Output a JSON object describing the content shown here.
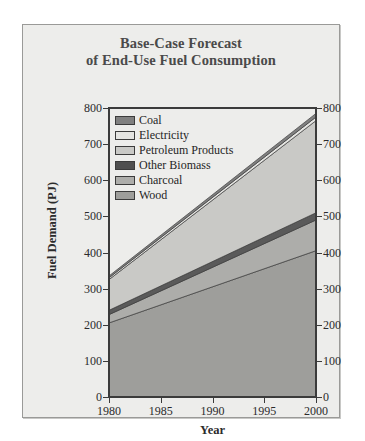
{
  "chart_data": {
    "type": "area",
    "title": "Base-Case Forecast of End-Use Fuel Consumption",
    "title_line1": "Base-Case Forecast",
    "title_line2": "of End-Use Fuel Consumption",
    "xlabel": "Year",
    "ylabel": "Fuel Demand (PJ)",
    "xlim": [
      1980,
      2000
    ],
    "ylim": [
      0,
      800
    ],
    "xticks": [
      1980,
      1985,
      1990,
      1995,
      2000
    ],
    "yticks": [
      0,
      100,
      200,
      300,
      400,
      500,
      600,
      700,
      800
    ],
    "grid": false,
    "stacked": true,
    "legend_position": "upper-left-inside",
    "x": [
      1980,
      2000
    ],
    "series": [
      {
        "name": "Wood",
        "color": "#9e9e9b",
        "values": [
          205,
          405
        ]
      },
      {
        "name": "Charcoal",
        "color": "#adadaa",
        "values": [
          23,
          85
        ]
      },
      {
        "name": "Other Biomass",
        "color": "#5a5a5a",
        "values": [
          12,
          20
        ]
      },
      {
        "name": "Petroleum Products",
        "color": "#c9c9c6",
        "values": [
          85,
          255
        ]
      },
      {
        "name": "Electricity",
        "color": "#e4e4e1",
        "values": [
          5,
          10
        ]
      },
      {
        "name": "Coal",
        "color": "#808080",
        "values": [
          5,
          10
        ]
      }
    ],
    "cumulative_totals": {
      "1980": {
        "Wood": 205,
        "Charcoal": 228,
        "Other Biomass": 240,
        "Petroleum Products": 325,
        "Electricity": 330,
        "Coal": 335
      },
      "2000": {
        "Wood": 405,
        "Charcoal": 490,
        "Other Biomass": 510,
        "Petroleum Products": 765,
        "Electricity": 775,
        "Coal": 785
      }
    },
    "legend_order": [
      "Coal",
      "Electricity",
      "Petroleum Products",
      "Other Biomass",
      "Charcoal",
      "Wood"
    ]
  },
  "legend": {
    "items": [
      {
        "label": "Coal",
        "color": "#808080"
      },
      {
        "label": "Electricity",
        "color": "#e4e4e1"
      },
      {
        "label": "Petroleum Products",
        "color": "#c9c9c6"
      },
      {
        "label": "Other Biomass",
        "color": "#4f4f4f"
      },
      {
        "label": "Charcoal",
        "color": "#adadaa"
      },
      {
        "label": "Wood",
        "color": "#9e9e9b"
      }
    ]
  },
  "axes": {
    "y_left": [
      "800",
      "700",
      "600",
      "500",
      "400",
      "300",
      "200",
      "100",
      "0"
    ],
    "y_right": [
      "800",
      "700",
      "600",
      "500",
      "400",
      "300",
      "200",
      "100",
      "0"
    ],
    "x": [
      "1980",
      "1985",
      "1990",
      "1995",
      "2000"
    ]
  },
  "colors": {
    "panel_bg": "#ededeb",
    "page_bg": "#ffffff",
    "axis": "#3b3b3b",
    "title": "#4a4a4a",
    "text": "#1f1f1f"
  }
}
